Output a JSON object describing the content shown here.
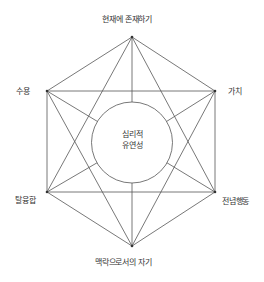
{
  "diagram": {
    "center": {
      "line1": "심리적",
      "line2": "유연성"
    },
    "nodes": {
      "top": "현재에 존재하기",
      "top_right": "가치",
      "bottom_right": "전념행동",
      "bottom": "맥락으로서의 자기",
      "bottom_left": "탈융합",
      "top_left": "수용"
    },
    "colors": {
      "line": "#555555",
      "text": "#333333",
      "background": "#ffffff"
    }
  }
}
